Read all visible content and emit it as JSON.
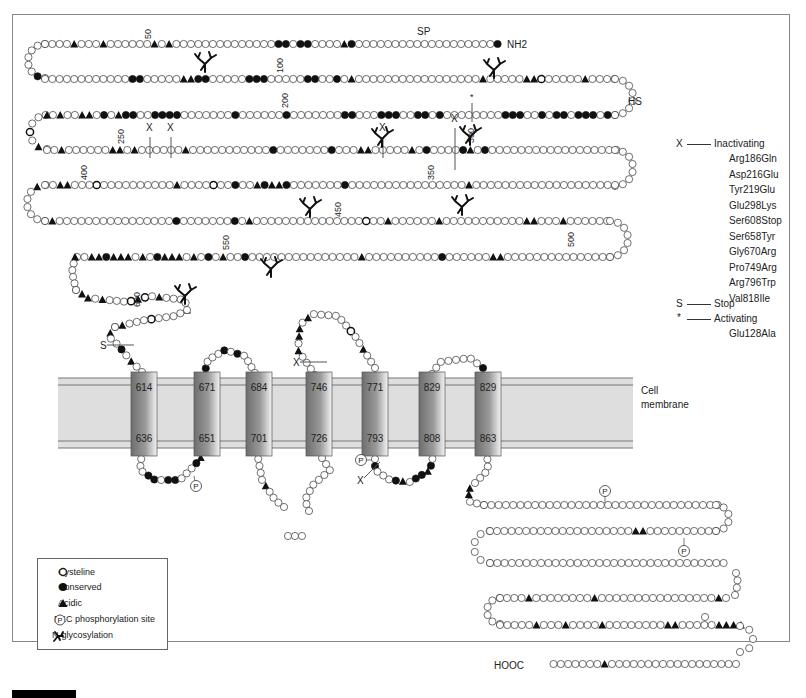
{
  "diagram": {
    "type": "protein topology / snake plot",
    "n_terminus": "NH2",
    "c_terminus": "HOOC",
    "region_labels": {
      "signal_peptide": "SP",
      "hinge_region": "HS"
    },
    "membrane_label_line1": "Cell",
    "membrane_label_line2": "membrane",
    "residue_numbers": [
      "50",
      "100",
      "200",
      "250",
      "300",
      "350",
      "400",
      "450",
      "500",
      "550",
      "600"
    ],
    "transmembrane_segments": [
      {
        "top": "614",
        "bottom": "636"
      },
      {
        "top": "671",
        "bottom": "651"
      },
      {
        "top": "684",
        "bottom": "701"
      },
      {
        "top": "746",
        "bottom": "726"
      },
      {
        "top": "771",
        "bottom": "793"
      },
      {
        "top": "829",
        "bottom": "808"
      },
      {
        "top": "829",
        "bottom": "863"
      }
    ],
    "markers": {
      "inactivating": "X",
      "stop": "S",
      "activating": "*",
      "phospho": "P"
    }
  },
  "mutations": {
    "inactivating_symbol": "X",
    "inactivating_label": "Inactivating",
    "inactivating_list": [
      "Arg186Gln",
      "Asp216Glu",
      "Tyr219Glu",
      "Glu298Lys",
      "Ser608Stop",
      "Ser658Tyr",
      "Gly670Arg",
      "Pro749Arg",
      "Arg796Trp",
      "Val818Ile"
    ],
    "stop_symbol": "S",
    "stop_label": "Stop",
    "activating_symbol": "*",
    "activating_label": "Activating",
    "activating_list": [
      "Glu128Ala"
    ]
  },
  "legend": {
    "items": [
      {
        "icon": "open-circle-icon",
        "label": "Cysteline"
      },
      {
        "icon": "filled-circle-icon",
        "label": "Conserved"
      },
      {
        "icon": "triangle-icon",
        "label": "Acidic"
      },
      {
        "icon": "phospho-p-icon",
        "label": "PKC phosphorylation site"
      },
      {
        "icon": "glycosylation-icon",
        "label": "N-glycosylation"
      }
    ]
  },
  "colors": {
    "membrane_fill": "#dedede",
    "membrane_line": "#777777",
    "helix_dark": "#7a7a7a",
    "helix_light": "#f2f2f2",
    "residue_stroke": "#333333",
    "residue_fill": "#ffffff",
    "marked_fill": "#111111"
  }
}
